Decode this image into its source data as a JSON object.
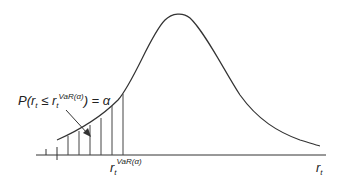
{
  "diagram": {
    "probability_label": {
      "prefix": "P(r",
      "sub1": "t",
      "leq": " ≤ r",
      "sub2": "t",
      "sup": "VaR(α)",
      "suffix": ") = α"
    },
    "var_label": {
      "base": "r",
      "sub": "t",
      "sup": "VaR(α)"
    },
    "axis_label": {
      "base": "r",
      "sub": "t"
    },
    "colors": {
      "curve": "#333333",
      "axis": "#333333",
      "hatch": "#444444"
    }
  }
}
